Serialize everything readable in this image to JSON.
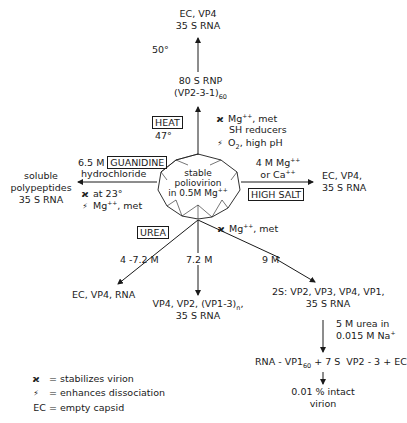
{
  "nodes": {
    "center": {
      "line1": "stable",
      "line2": "poliovirion",
      "line3": "in 0.5M Mg",
      "line3_sup": "++"
    },
    "top": {
      "line1": "EC, VP4",
      "line2": "35 S RNA"
    },
    "rnp": {
      "line1": "80 S RNP",
      "line2": "(VP2-3-1)",
      "line2_sub": "60"
    },
    "left": {
      "line1": "soluble",
      "line2": "polypeptides",
      "line3": "35 S RNA"
    },
    "right": {
      "line1": "EC, VP4,",
      "line2": "35 S RNA"
    },
    "urea_a": {
      "line1": "EC, VP4, RNA"
    },
    "urea_b": {
      "line1": "VP4, VP2, (VP1-3)",
      "line1_sub": "n",
      "line1_tail": ",",
      "line2": "35 S RNA"
    },
    "urea_c": {
      "line1": "2S: VP2, VP3, VP4, VP1,",
      "line2": "35 S RNA"
    },
    "rna_vp1": {
      "part1": "RNA - VP1",
      "sub": "60",
      "part2": " + 7 S  VP2 - 3 + EC"
    },
    "intact": {
      "line1": "0.01 % intact",
      "line2": "virion"
    }
  },
  "conditions": {
    "heat_label": "HEAT",
    "heat_temp": "47°",
    "fifty": "50°",
    "heat_stab_symbol": "ϰ",
    "heat_stab_1": "Mg",
    "heat_stab_1_sup": "++",
    "heat_stab_1_tail": ", met",
    "heat_stab_2": "SH  reducers",
    "heat_diss_symbol": "⚡",
    "heat_diss_1": "O",
    "heat_diss_1_sub": "2",
    "heat_diss_1_tail": ",  high  pH",
    "guan_conc": "6.5 M",
    "guan_label": "GUANIDINE",
    "guan_line2": "hydrochloride",
    "guan_stab": "at 23°",
    "guan_diss": "Mg",
    "guan_diss_sup": "++",
    "guan_diss_tail": ", met",
    "salt_line1": "4 M Mg",
    "salt_line1_sup": "++",
    "salt_line2": "or Ca",
    "salt_line2_sup": "++",
    "salt_label": "HIGH SALT",
    "urea_label": "UREA",
    "urea_stab": "Mg",
    "urea_stab_sup": "++",
    "urea_stab_tail": ",   met",
    "urea_a_conc": "4 -7.2 M",
    "urea_b_conc": "7.2 M",
    "urea_c_conc": "9 M",
    "dialysis_1": "5 M urea  in",
    "dialysis_2": "0.015 M  Na",
    "dialysis_2_sup": "+"
  },
  "legend": [
    {
      "symbol": "ϰ",
      "text": "=  stabilizes virion"
    },
    {
      "symbol": "⚡",
      "text": "=  enhances dissociation"
    },
    {
      "symbol": "EC",
      "text": "=  empty capsid"
    }
  ]
}
